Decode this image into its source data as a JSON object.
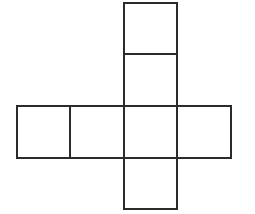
{
  "diagram": {
    "title": "",
    "type": "cube-net",
    "stroke_color": "#2b2b2b",
    "background": "#ffffff",
    "stroke_width": 2,
    "faces": [
      {
        "id": "top-1",
        "x": 124,
        "y": 3,
        "w": 53,
        "h": 51
      },
      {
        "id": "top-2",
        "x": 124,
        "y": 54,
        "w": 53,
        "h": 52
      },
      {
        "id": "left-1",
        "x": 17,
        "y": 106,
        "w": 53,
        "h": 52
      },
      {
        "id": "left-2",
        "x": 70,
        "y": 106,
        "w": 54,
        "h": 52
      },
      {
        "id": "center",
        "x": 124,
        "y": 106,
        "w": 53,
        "h": 52
      },
      {
        "id": "right",
        "x": 177,
        "y": 106,
        "w": 54,
        "h": 52
      },
      {
        "id": "bottom",
        "x": 124,
        "y": 158,
        "w": 53,
        "h": 51
      }
    ]
  }
}
